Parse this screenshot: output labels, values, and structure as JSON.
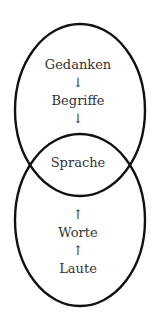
{
  "diagram": {
    "top_ellipse": {
      "cx": 80,
      "cy": 110,
      "rx": 65,
      "ry": 86
    },
    "bottom_ellipse": {
      "cx": 80,
      "cy": 220,
      "rx": 65,
      "ry": 86
    },
    "stroke_color": "#111111",
    "labels": {
      "gedanken": "Gedanken",
      "arrow1": "↓",
      "begriffe": "Begriffe",
      "arrow2": "↓",
      "sprache": "Sprache",
      "arrow3": "↑",
      "worte": "Worte",
      "arrow4": "↑",
      "laute": "Laute"
    }
  }
}
